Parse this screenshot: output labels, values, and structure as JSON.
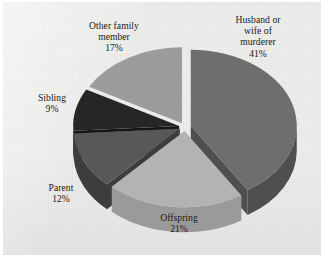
{
  "chart_data": {
    "type": "pie",
    "title": "",
    "subtitle": "",
    "xlabel": "",
    "ylabel": "",
    "legend_position": "labels-outside",
    "grid": false,
    "exploded": true,
    "three_d": true,
    "categories": [
      "Husband or wife of murderer",
      "Offspring",
      "Parent",
      "Sibling",
      "Other family member"
    ],
    "values": [
      41,
      21,
      12,
      9,
      17
    ],
    "value_unit": "%",
    "slices": [
      {
        "label_lines": [
          "Husband or",
          "wife of",
          "murderer"
        ],
        "label": "Husband or wife of murderer",
        "value": 41,
        "value_text": "41%",
        "color": "#6e6e6e",
        "side_color": "#4f4f4f"
      },
      {
        "label_lines": [
          "Offspring"
        ],
        "label": "Offspring",
        "value": 21,
        "value_text": "21%",
        "color": "#b3b3b3",
        "side_color": "#9a9a9a"
      },
      {
        "label_lines": [
          "Parent"
        ],
        "label": "Parent",
        "value": 12,
        "value_text": "12%",
        "color": "#585858",
        "side_color": "#3d3d3d"
      },
      {
        "label_lines": [
          "Sibling"
        ],
        "label": "Sibling",
        "value": 9,
        "value_text": "9%",
        "color": "#262626",
        "side_color": "#161616"
      },
      {
        "label_lines": [
          "Other family",
          "member"
        ],
        "label": "Other family member",
        "value": 17,
        "value_text": "17%",
        "color": "#9c9c9c",
        "side_color": "#7d7d7d"
      }
    ],
    "background_color": "#ececea",
    "label_color": "#1b1b1b"
  },
  "labels": {
    "husband": {
      "line1": "Husband or",
      "line2": "wife of",
      "line3": "murderer",
      "value": "41%"
    },
    "other": {
      "line1": "Other family",
      "line2": "member",
      "value": "17%"
    },
    "sibling": {
      "line1": "Sibling",
      "value": "9%"
    },
    "parent": {
      "line1": "Parent",
      "value": "12%"
    },
    "offspring": {
      "line1": "Offspring",
      "value": "21%"
    }
  }
}
